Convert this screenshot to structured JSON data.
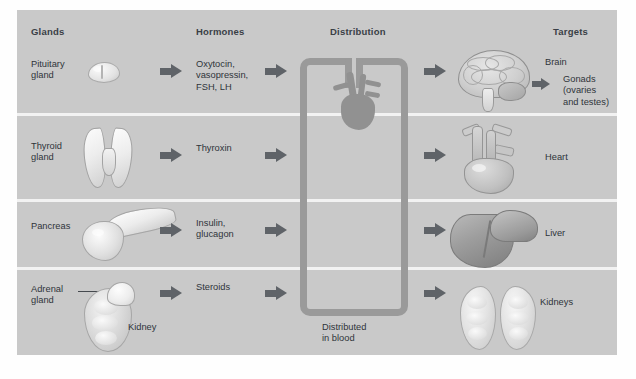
{
  "diagram": {
    "panel_color": "#c9c9c9",
    "divider_color": "#f2f2f2",
    "arrow_color": "#5f6368",
    "vessel_color": "#9a9a9a",
    "text_color": "#2f343a"
  },
  "columns": [
    {
      "label": "Glands"
    },
    {
      "label": "Hormones"
    },
    {
      "label": "Distribution"
    },
    {
      "label": "Targets"
    }
  ],
  "rows": [
    {
      "gland": "Pituitary\ngland",
      "gland_icon": "pituitary-gland-illustration",
      "hormones": "Oxytocin,\nvasopressin,\nFSH, LH",
      "target_icon": "brain-illustration",
      "targets": [
        "Brain",
        "Gonads\n(ovaries\nand testes)"
      ]
    },
    {
      "gland": "Thyroid\ngland",
      "gland_icon": "thyroid-gland-illustration",
      "hormones": "Thyroxin",
      "target_icon": "heart-illustration",
      "targets": [
        "Heart"
      ]
    },
    {
      "gland": "Pancreas",
      "gland_icon": "pancreas-illustration",
      "hormones": "Insulin,\nglucagon",
      "target_icon": "liver-illustration",
      "targets": [
        "Liver"
      ]
    },
    {
      "gland": "Adrenal\ngland",
      "gland_icon": "adrenal-gland-kidney-illustration",
      "gland_callout": "Kidney",
      "hormones": "Steroids",
      "target_icon": "kidneys-illustration",
      "targets": [
        "Kidneys"
      ]
    }
  ],
  "distribution": {
    "caption": "Distributed\nin blood",
    "vessel_icon": "blood-vessel-loop",
    "heart_icon": "heart-illustration"
  }
}
